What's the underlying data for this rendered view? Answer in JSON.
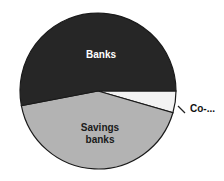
{
  "chart_data": {
    "type": "pie",
    "title": "",
    "start_angle_deg": 0,
    "direction": "clockwise",
    "slices": [
      {
        "label": "Co-...",
        "value": 4.5,
        "color": "#f2f2f2",
        "label_color": "#111111",
        "label_outside": true
      },
      {
        "label": "Savings banks",
        "label_lines": [
          "Savings",
          "banks"
        ],
        "value": 42.5,
        "color": "#b3b3b3",
        "label_color": "#1a1a1a",
        "label_outside": false
      },
      {
        "label": "Banks",
        "label_lines": [
          "Banks"
        ],
        "value": 53,
        "color": "#262626",
        "label_color": "#ffffff",
        "label_outside": false
      }
    ],
    "legend": "none",
    "labels": {
      "banks": "Banks",
      "savings_line1": "Savings",
      "savings_line2": "banks",
      "co": "Co-..."
    },
    "geometry": {
      "cx": 98,
      "cy": 91,
      "r": 78
    }
  }
}
